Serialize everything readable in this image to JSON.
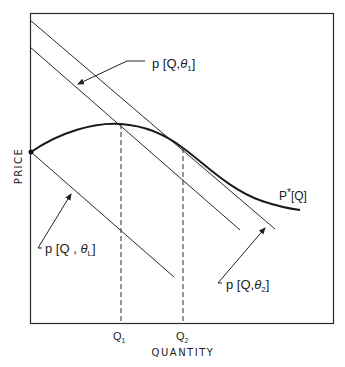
{
  "diagram": {
    "axes": {
      "x_label": "QUANTITY",
      "y_label": "PRICE",
      "x_ticks": [
        {
          "label": "Q",
          "sub": "1"
        },
        {
          "label": "Q",
          "sub": "2"
        }
      ]
    },
    "curves": {
      "p_star": {
        "label_main": "P",
        "label_star": "*",
        "label_arg": "[Q]"
      },
      "theta1": {
        "prefix": "p [Q,",
        "sym": "θ",
        "sub": "1",
        "suffix": "]"
      },
      "theta2": {
        "prefix": "p [Q,",
        "sym": "θ",
        "sub": "2",
        "suffix": "]"
      },
      "thetaL": {
        "prefix": "p [Q , ",
        "sym": "θ",
        "sub": "L",
        "suffix": "]"
      }
    },
    "colors": {
      "line": "#2a2a2a",
      "curve": "#1a1a1a",
      "background": "#ffffff"
    }
  }
}
